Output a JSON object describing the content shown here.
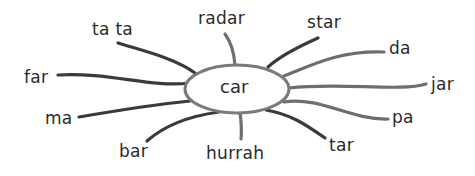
{
  "diagram": {
    "type": "word-web",
    "center": {
      "label": "car",
      "cx": 237,
      "cy": 89,
      "rx": 52,
      "ry": 24
    },
    "spokes": [
      {
        "label": "ta ta",
        "x": 92,
        "y": 21,
        "path": "M118,43 C140,50 175,58 195,73"
      },
      {
        "label": "radar",
        "x": 198,
        "y": 10,
        "path": "M225,34 C231,42 234,52 235,65"
      },
      {
        "label": "star",
        "x": 307,
        "y": 14,
        "path": "M318,38 C300,46 280,56 268,67"
      },
      {
        "label": "da",
        "x": 389,
        "y": 40,
        "path": "M384,52 C340,50 310,66 284,76"
      },
      {
        "label": "far",
        "x": 24,
        "y": 69,
        "path": "M58,75 C110,72 150,88 190,83"
      },
      {
        "label": "jar",
        "x": 431,
        "y": 76,
        "path": "M426,84 C400,92 340,82 289,88"
      },
      {
        "label": "ma",
        "x": 45,
        "y": 110,
        "path": "M79,117 C120,110 160,104 190,101"
      },
      {
        "label": "pa",
        "x": 392,
        "y": 109,
        "path": "M388,119 C350,120 320,96 284,102"
      },
      {
        "label": "bar",
        "x": 119,
        "y": 143,
        "path": "M147,141 C165,125 190,116 219,112"
      },
      {
        "label": "hurrah",
        "x": 206,
        "y": 145,
        "path": "M240,112 C241,120 242,130 241,139"
      },
      {
        "label": "tar",
        "x": 329,
        "y": 137,
        "path": "M325,138 C305,124 290,114 266,110"
      }
    ],
    "colors": {
      "line": "#6e6e6e",
      "line_dark": "#3a3a3a",
      "text": "#2a2a2a",
      "background": "#ffffff",
      "ellipse_fill": "#ffffff"
    }
  }
}
